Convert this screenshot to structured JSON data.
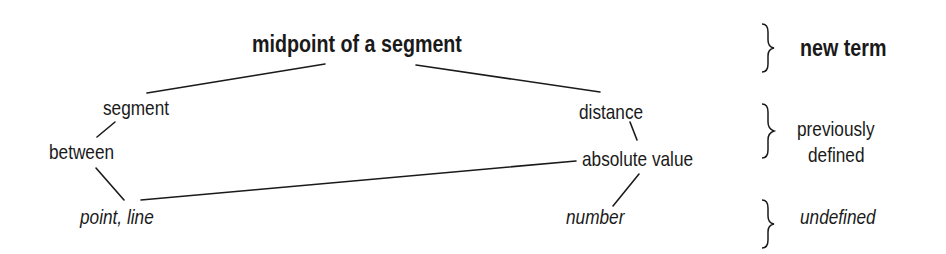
{
  "diagram": {
    "title_term": "midpoint of a segment",
    "nodes": [
      {
        "id": "segment",
        "label": "segment",
        "level": "previously defined"
      },
      {
        "id": "distance",
        "label": "distance",
        "level": "previously defined"
      },
      {
        "id": "between",
        "label": "between",
        "level": "previously defined"
      },
      {
        "id": "absolute_value",
        "label": "absolute value",
        "level": "previously defined"
      },
      {
        "id": "point_line",
        "label": "point, line",
        "level": "undefined"
      },
      {
        "id": "number",
        "label": "number",
        "level": "undefined"
      }
    ],
    "edges": [
      [
        "midpoint of a segment",
        "segment"
      ],
      [
        "midpoint of a segment",
        "distance"
      ],
      [
        "segment",
        "between"
      ],
      [
        "between",
        "point, line"
      ],
      [
        "distance",
        "absolute value"
      ],
      [
        "absolute value",
        "point, line"
      ],
      [
        "absolute value",
        "number"
      ]
    ],
    "categories": {
      "new_term": "new term",
      "previously_line1": "previously",
      "previously_line2": "defined",
      "undefined": "undefined"
    }
  }
}
